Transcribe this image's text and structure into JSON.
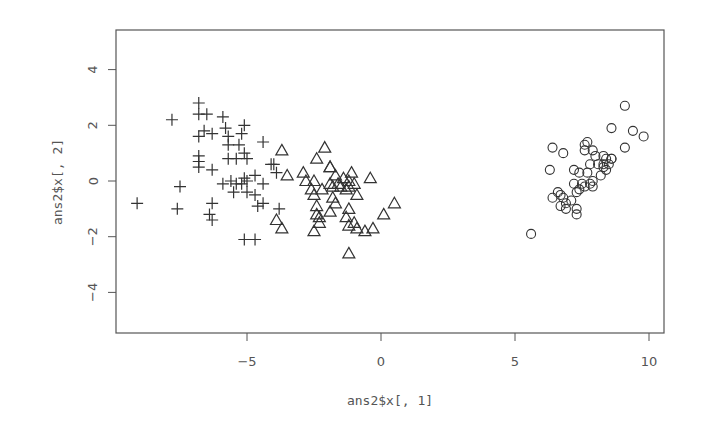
{
  "chart_data": {
    "type": "scatter",
    "title": "",
    "xlabel": "ans2$x[, 1]",
    "ylabel": "ans2$x[, 2]",
    "xlim": [
      -9.9,
      10.6
    ],
    "ylim": [
      -5.5,
      5.5
    ],
    "x_ticks": [
      -5,
      0,
      5,
      10
    ],
    "x_tick_labels": [
      "-5",
      "0",
      "5",
      "10"
    ],
    "y_ticks": [
      -4,
      -2,
      0,
      2,
      4
    ],
    "y_tick_labels": [
      "-4",
      "-2",
      "0",
      "2",
      "4"
    ],
    "grid": false,
    "legend": null,
    "series": [
      {
        "name": "group-plus",
        "marker": "plus",
        "points": [
          [
            -9.1,
            -0.8
          ],
          [
            -7.8,
            2.2
          ],
          [
            -7.6,
            -1.0
          ],
          [
            -7.5,
            -0.2
          ],
          [
            -6.8,
            2.8
          ],
          [
            -6.8,
            2.4
          ],
          [
            -6.5,
            2.4
          ],
          [
            -6.6,
            1.8
          ],
          [
            -6.8,
            1.6
          ],
          [
            -6.8,
            0.9
          ],
          [
            -6.8,
            0.7
          ],
          [
            -6.8,
            0.5
          ],
          [
            -6.3,
            0.4
          ],
          [
            -6.3,
            -0.8
          ],
          [
            -6.4,
            -1.2
          ],
          [
            -6.3,
            -1.4
          ],
          [
            -6.3,
            1.7
          ],
          [
            -5.9,
            2.3
          ],
          [
            -5.8,
            1.9
          ],
          [
            -5.7,
            1.6
          ],
          [
            -5.7,
            1.3
          ],
          [
            -5.7,
            0.8
          ],
          [
            -5.9,
            -0.1
          ],
          [
            -5.4,
            0.8
          ],
          [
            -5.3,
            1.3
          ],
          [
            -5.2,
            1.7
          ],
          [
            -5.1,
            1.0
          ],
          [
            -5.1,
            2.0
          ],
          [
            -5.0,
            0.8
          ],
          [
            -5.1,
            0.1
          ],
          [
            -5.4,
            -0.1
          ],
          [
            -5.5,
            -0.4
          ],
          [
            -5.0,
            -0.4
          ],
          [
            -5.1,
            -2.1
          ],
          [
            -4.7,
            -2.1
          ],
          [
            -4.7,
            -0.5
          ],
          [
            -4.4,
            1.4
          ],
          [
            -4.4,
            -0.1
          ],
          [
            -4.1,
            0.6
          ],
          [
            -4.0,
            0.6
          ],
          [
            -3.9,
            0.3
          ],
          [
            -4.6,
            -0.9
          ],
          [
            -4.4,
            -0.8
          ],
          [
            -3.8,
            -1.0
          ],
          [
            -5.6,
            0.0
          ],
          [
            -5.2,
            -0.1
          ],
          [
            -5.0,
            0.0
          ],
          [
            -4.7,
            0.2
          ]
        ]
      },
      {
        "name": "group-triangle",
        "marker": "triangle",
        "points": [
          [
            -3.7,
            1.1
          ],
          [
            -3.5,
            0.2
          ],
          [
            -2.9,
            0.3
          ],
          [
            -2.8,
            0.0
          ],
          [
            -2.4,
            0.8
          ],
          [
            -2.1,
            1.2
          ],
          [
            -1.9,
            0.5
          ],
          [
            -1.9,
            0.5
          ],
          [
            -1.7,
            0.2
          ],
          [
            -2.5,
            0.0
          ],
          [
            -2.6,
            -0.3
          ],
          [
            -2.2,
            -0.3
          ],
          [
            -1.9,
            -0.1
          ],
          [
            -1.4,
            0.1
          ],
          [
            -1.2,
            0.0
          ],
          [
            -1.1,
            0.3
          ],
          [
            -1.3,
            -0.3
          ],
          [
            -1.5,
            -0.2
          ],
          [
            -1.6,
            -0.1
          ],
          [
            -1.8,
            -0.2
          ],
          [
            -1.2,
            -0.2
          ],
          [
            -1.0,
            -0.1
          ],
          [
            -0.9,
            -0.5
          ],
          [
            -0.4,
            0.1
          ],
          [
            -3.9,
            -1.4
          ],
          [
            -3.7,
            -1.7
          ],
          [
            -2.5,
            -0.5
          ],
          [
            -2.4,
            -0.9
          ],
          [
            -2.4,
            -1.2
          ],
          [
            -2.3,
            -1.3
          ],
          [
            -2.3,
            -1.5
          ],
          [
            -2.5,
            -1.8
          ],
          [
            -1.9,
            -1.1
          ],
          [
            -1.7,
            -0.8
          ],
          [
            -1.3,
            -1.3
          ],
          [
            -1.2,
            -1.6
          ],
          [
            -1.0,
            -1.5
          ],
          [
            -0.6,
            -1.8
          ],
          [
            -0.3,
            -1.7
          ],
          [
            0.1,
            -1.2
          ],
          [
            0.5,
            -0.8
          ],
          [
            -1.2,
            -2.6
          ],
          [
            -1.2,
            -1.0
          ],
          [
            -0.9,
            -1.7
          ],
          [
            -1.8,
            -0.6
          ]
        ]
      },
      {
        "name": "group-circle",
        "marker": "circle",
        "points": [
          [
            5.6,
            -1.9
          ],
          [
            6.3,
            0.4
          ],
          [
            6.4,
            1.2
          ],
          [
            6.8,
            1.0
          ],
          [
            6.6,
            -0.4
          ],
          [
            6.7,
            -0.9
          ],
          [
            6.8,
            -0.6
          ],
          [
            6.9,
            -0.8
          ],
          [
            6.9,
            -1.0
          ],
          [
            7.1,
            -0.7
          ],
          [
            7.2,
            0.4
          ],
          [
            7.2,
            -0.1
          ],
          [
            7.3,
            -0.4
          ],
          [
            7.3,
            -1.0
          ],
          [
            7.3,
            -1.2
          ],
          [
            7.4,
            0.3
          ],
          [
            7.4,
            -0.3
          ],
          [
            7.5,
            -0.1
          ],
          [
            7.6,
            -0.2
          ],
          [
            7.6,
            1.3
          ],
          [
            7.6,
            1.1
          ],
          [
            7.7,
            1.4
          ],
          [
            7.7,
            0.3
          ],
          [
            7.8,
            0.6
          ],
          [
            7.8,
            -0.1
          ],
          [
            7.9,
            -0.2
          ],
          [
            7.9,
            0.0
          ],
          [
            7.9,
            1.1
          ],
          [
            8.0,
            0.9
          ],
          [
            8.1,
            0.6
          ],
          [
            8.2,
            0.2
          ],
          [
            8.3,
            0.6
          ],
          [
            8.3,
            0.5
          ],
          [
            8.3,
            0.9
          ],
          [
            8.4,
            0.8
          ],
          [
            8.4,
            0.4
          ],
          [
            8.5,
            0.6
          ],
          [
            8.6,
            1.9
          ],
          [
            8.6,
            0.8
          ],
          [
            8.6,
            0.8
          ],
          [
            9.1,
            1.2
          ],
          [
            9.1,
            2.7
          ],
          [
            9.4,
            1.8
          ],
          [
            9.8,
            1.6
          ],
          [
            6.4,
            -0.6
          ],
          [
            6.7,
            -0.5
          ]
        ]
      }
    ]
  },
  "colors": {
    "background": "#ffffff",
    "axis": "#555555",
    "points": "#333333",
    "text": "#555555"
  }
}
